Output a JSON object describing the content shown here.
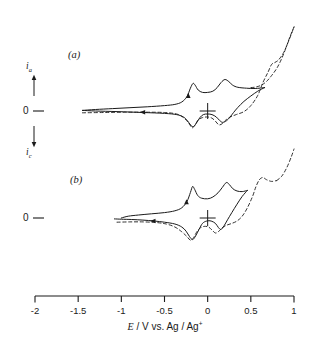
{
  "figure": {
    "kind": "cyclic-voltammogram",
    "background_color": "#ffffff",
    "line_color": "#1a1a1a"
  },
  "panels": [
    {
      "id": "a",
      "label": "(a)",
      "zero_label": "0"
    },
    {
      "id": "b",
      "label": "(b)",
      "zero_label": "0"
    }
  ],
  "y_axis": {
    "anodic_label": "i",
    "anodic_sub": "a",
    "cathodic_label": "i",
    "cathodic_sub": "c",
    "zero_label": "0",
    "up_arrow": "up-arrow-icon",
    "down_arrow": "down-arrow-icon"
  },
  "x_axis": {
    "title_symbol": "E",
    "title_rest": " / V vs. Ag / Ag",
    "title_sup": "+",
    "title_full": "E / V vs. Ag / Ag+",
    "min": -2,
    "max": 1,
    "ticks": [
      -2,
      -1.5,
      -1,
      -0.5,
      0,
      0.5,
      1
    ],
    "tick_labels": [
      "-2",
      "-1.5",
      "-1",
      "-0.5",
      "0",
      "0.5",
      "1"
    ]
  },
  "chart_data": {
    "type": "line",
    "title": "",
    "xlabel": "E / V vs. Ag / Ag+",
    "ylabel": "i (anodic up / cathodic down)",
    "xlim": [
      -2,
      1
    ],
    "grid": false,
    "legend": "none",
    "annotations": [
      {
        "text": "(a)",
        "x": -1.6,
        "panel": "a"
      },
      {
        "text": "(b)",
        "x": -1.55,
        "panel": "b"
      },
      {
        "text": "origin-crosshair",
        "x": 0.0,
        "y": 0.0,
        "panel": "a"
      },
      {
        "text": "origin-crosshair",
        "x": 0.0,
        "y": 0.0,
        "panel": "b"
      },
      {
        "text": "scan-direction-arrow-reverse",
        "x": -0.75,
        "panel": "a"
      },
      {
        "text": "scan-direction-arrow-forward",
        "x": -0.22,
        "panel": "a"
      },
      {
        "text": "scan-direction-arrow-reverse",
        "x": -0.63,
        "panel": "b"
      },
      {
        "text": "scan-direction-arrow-forward",
        "x": -0.27,
        "panel": "b"
      }
    ],
    "series": [
      {
        "name": "panel-a-solid-forward",
        "panel": "a",
        "style": "solid",
        "points": [
          [
            -1.45,
            0.02
          ],
          [
            -1.3,
            0.05
          ],
          [
            -1.1,
            0.08
          ],
          [
            -0.9,
            0.11
          ],
          [
            -0.7,
            0.14
          ],
          [
            -0.5,
            0.18
          ],
          [
            -0.38,
            0.22
          ],
          [
            -0.3,
            0.3
          ],
          [
            -0.24,
            0.48
          ],
          [
            -0.2,
            0.76
          ],
          [
            -0.17,
            0.92
          ],
          [
            -0.145,
            0.86
          ],
          [
            -0.11,
            0.7
          ],
          [
            -0.06,
            0.62
          ],
          [
            0.0,
            0.62
          ],
          [
            0.06,
            0.66
          ],
          [
            0.11,
            0.78
          ],
          [
            0.155,
            0.95
          ],
          [
            0.2,
            1.05
          ],
          [
            0.245,
            0.98
          ],
          [
            0.29,
            0.86
          ],
          [
            0.35,
            0.79
          ],
          [
            0.45,
            0.76
          ],
          [
            0.55,
            0.75
          ],
          [
            0.66,
            0.78
          ]
        ]
      },
      {
        "name": "panel-a-solid-reverse",
        "panel": "a",
        "style": "solid",
        "points": [
          [
            0.66,
            0.78
          ],
          [
            0.58,
            0.66
          ],
          [
            0.5,
            0.5
          ],
          [
            0.42,
            0.32
          ],
          [
            0.35,
            0.12
          ],
          [
            0.3,
            -0.05
          ],
          [
            0.26,
            -0.2
          ],
          [
            0.22,
            -0.32
          ],
          [
            0.175,
            -0.38
          ],
          [
            0.14,
            -0.32
          ],
          [
            0.1,
            -0.2
          ],
          [
            0.05,
            -0.12
          ],
          [
            0.0,
            -0.1
          ],
          [
            -0.05,
            -0.12
          ],
          [
            -0.09,
            -0.22
          ],
          [
            -0.13,
            -0.4
          ],
          [
            -0.165,
            -0.52
          ],
          [
            -0.2,
            -0.46
          ],
          [
            -0.235,
            -0.32
          ],
          [
            -0.28,
            -0.2
          ],
          [
            -0.36,
            -0.12
          ],
          [
            -0.5,
            -0.08
          ],
          [
            -0.75,
            -0.05
          ],
          [
            -1.05,
            -0.02
          ],
          [
            -1.3,
            0.0
          ],
          [
            -1.45,
            0.02
          ]
        ]
      },
      {
        "name": "panel-a-dashed-extended",
        "panel": "a",
        "style": "dashed",
        "points": [
          [
            -1.45,
            -0.06
          ],
          [
            -1.2,
            -0.05
          ],
          [
            -0.95,
            -0.04
          ],
          [
            -0.7,
            -0.04
          ],
          [
            -0.5,
            -0.05
          ],
          [
            -0.36,
            -0.1
          ],
          [
            -0.28,
            -0.22
          ],
          [
            -0.22,
            -0.4
          ],
          [
            -0.18,
            -0.56
          ],
          [
            -0.15,
            -0.48
          ],
          [
            -0.11,
            -0.3
          ],
          [
            -0.06,
            -0.22
          ],
          [
            0.0,
            -0.2
          ],
          [
            0.05,
            -0.24
          ],
          [
            0.09,
            -0.34
          ],
          [
            0.13,
            -0.46
          ],
          [
            0.17,
            -0.42
          ],
          [
            0.21,
            -0.3
          ],
          [
            0.26,
            -0.2
          ],
          [
            0.33,
            -0.12
          ],
          [
            0.42,
            -0.02
          ],
          [
            0.5,
            0.18
          ],
          [
            0.58,
            0.52
          ],
          [
            0.64,
            0.95
          ],
          [
            0.7,
            1.3
          ],
          [
            0.74,
            1.55
          ],
          [
            0.78,
            1.62
          ],
          [
            0.82,
            1.7
          ],
          [
            0.88,
            1.95
          ],
          [
            0.94,
            2.35
          ],
          [
            1.0,
            2.8
          ]
        ]
      },
      {
        "name": "panel-a-dashed-return",
        "panel": "a",
        "style": "dashed",
        "points": [
          [
            1.0,
            2.8
          ],
          [
            0.95,
            2.45
          ],
          [
            0.9,
            2.05
          ],
          [
            0.85,
            1.7
          ],
          [
            0.8,
            1.42
          ],
          [
            0.74,
            1.18
          ],
          [
            0.68,
            0.98
          ],
          [
            0.62,
            0.86
          ],
          [
            0.56,
            0.8
          ],
          [
            0.5,
            0.78
          ]
        ]
      },
      {
        "name": "panel-b-solid-forward",
        "panel": "b",
        "style": "solid",
        "points": [
          [
            -1.0,
            0.0
          ],
          [
            -0.92,
            0.06
          ],
          [
            -0.8,
            0.1
          ],
          [
            -0.65,
            0.14
          ],
          [
            -0.5,
            0.18
          ],
          [
            -0.38,
            0.24
          ],
          [
            -0.3,
            0.34
          ],
          [
            -0.24,
            0.55
          ],
          [
            -0.2,
            0.85
          ],
          [
            -0.175,
            1.05
          ],
          [
            -0.15,
            0.95
          ],
          [
            -0.115,
            0.75
          ],
          [
            -0.07,
            0.66
          ],
          [
            0.0,
            0.64
          ],
          [
            0.06,
            0.7
          ],
          [
            0.12,
            0.84
          ],
          [
            0.17,
            1.02
          ],
          [
            0.215,
            1.18
          ],
          [
            0.25,
            1.12
          ],
          [
            0.29,
            0.98
          ],
          [
            0.34,
            0.9
          ],
          [
            0.4,
            0.88
          ],
          [
            0.46,
            0.92
          ]
        ]
      },
      {
        "name": "panel-b-solid-reverse",
        "panel": "b",
        "style": "solid",
        "points": [
          [
            0.46,
            0.92
          ],
          [
            0.4,
            0.72
          ],
          [
            0.34,
            0.46
          ],
          [
            0.28,
            0.18
          ],
          [
            0.23,
            -0.06
          ],
          [
            0.19,
            -0.26
          ],
          [
            0.155,
            -0.38
          ],
          [
            0.125,
            -0.32
          ],
          [
            0.09,
            -0.18
          ],
          [
            0.04,
            -0.1
          ],
          [
            -0.01,
            -0.1
          ],
          [
            -0.06,
            -0.18
          ],
          [
            -0.1,
            -0.38
          ],
          [
            -0.14,
            -0.6
          ],
          [
            -0.175,
            -0.72
          ],
          [
            -0.21,
            -0.62
          ],
          [
            -0.25,
            -0.44
          ],
          [
            -0.3,
            -0.3
          ],
          [
            -0.38,
            -0.2
          ],
          [
            -0.5,
            -0.14
          ],
          [
            -0.62,
            -0.1
          ],
          [
            -0.75,
            -0.07
          ],
          [
            -0.88,
            -0.05
          ],
          [
            -1.0,
            -0.04
          ],
          [
            -1.08,
            -0.03
          ]
        ]
      },
      {
        "name": "panel-b-dashed-extended",
        "panel": "b",
        "style": "dashed",
        "points": [
          [
            -1.05,
            -0.14
          ],
          [
            -0.9,
            -0.13
          ],
          [
            -0.75,
            -0.13
          ],
          [
            -0.6,
            -0.15
          ],
          [
            -0.48,
            -0.2
          ],
          [
            -0.38,
            -0.3
          ],
          [
            -0.3,
            -0.46
          ],
          [
            -0.24,
            -0.62
          ],
          [
            -0.2,
            -0.74
          ],
          [
            -0.165,
            -0.66
          ],
          [
            -0.13,
            -0.48
          ],
          [
            -0.09,
            -0.34
          ],
          [
            -0.04,
            -0.28
          ],
          [
            0.01,
            -0.3
          ],
          [
            0.05,
            -0.4
          ],
          [
            0.09,
            -0.5
          ],
          [
            0.13,
            -0.44
          ],
          [
            0.17,
            -0.32
          ],
          [
            0.22,
            -0.24
          ],
          [
            0.28,
            -0.18
          ],
          [
            0.34,
            -0.1
          ],
          [
            0.4,
            0.06
          ],
          [
            0.46,
            0.34
          ],
          [
            0.52,
            0.72
          ],
          [
            0.56,
            1.05
          ],
          [
            0.6,
            1.28
          ],
          [
            0.64,
            1.35
          ],
          [
            0.68,
            1.28
          ],
          [
            0.74,
            1.22
          ],
          [
            0.8,
            1.25
          ]
        ]
      },
      {
        "name": "panel-b-dashed-return",
        "panel": "b",
        "style": "dashed",
        "points": [
          [
            0.8,
            1.25
          ],
          [
            0.86,
            1.4
          ],
          [
            0.92,
            1.7
          ],
          [
            0.97,
            2.05
          ],
          [
            1.0,
            2.3
          ]
        ]
      }
    ]
  }
}
